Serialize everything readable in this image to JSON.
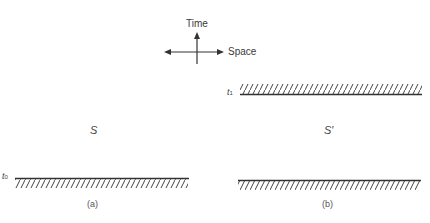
{
  "axes": {
    "vertical_label": "Time",
    "horizontal_label": "Space"
  },
  "panel_a": {
    "frame_label": "S",
    "time_label": "t",
    "time_subscript": "0",
    "caption": "(a)"
  },
  "panel_b": {
    "frame_label": "S′",
    "time_label_top": "t",
    "time_subscript_top": "1",
    "caption": "(b)"
  },
  "colors": {
    "line": "#333333",
    "background": "#ffffff"
  }
}
